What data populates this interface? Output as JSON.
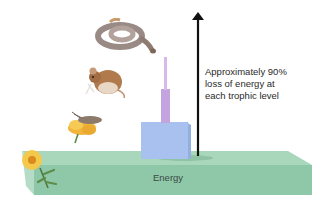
{
  "diagram": {
    "annotation": {
      "line1": "Approximately 90%",
      "line2": "loss of energy at",
      "line3": "each trophic level"
    },
    "base_label": "Energy",
    "organisms": [
      {
        "name": "snake",
        "level": "tertiary consumer"
      },
      {
        "name": "mouse",
        "level": "secondary consumer"
      },
      {
        "name": "grasshopper-on-flower",
        "level": "primary consumer"
      },
      {
        "name": "flower",
        "level": "producer"
      }
    ],
    "colors": {
      "base": "#8ccaa6",
      "base_side": "#79b893",
      "base_top": "#a6d8bb",
      "block_primary": "#a9c2ef",
      "block_secondary": "#c7a6e0",
      "block_tertiary": "#dcb8ea",
      "arrow": "#111111"
    }
  }
}
